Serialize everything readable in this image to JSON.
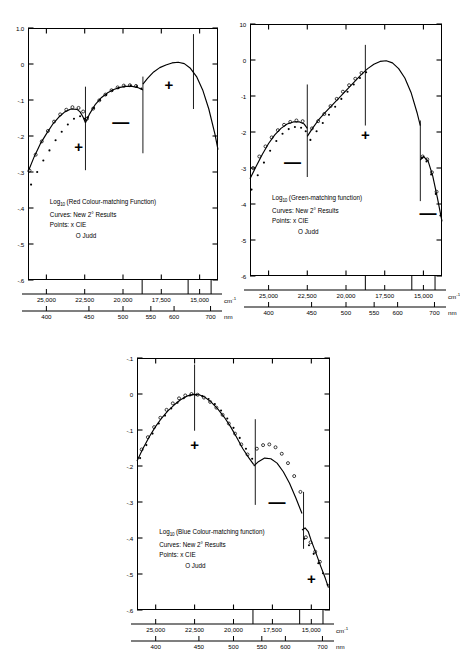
{
  "figure": {
    "title": "",
    "panel_count": 3
  },
  "common": {
    "x_axis_primary": {
      "unit": "cm",
      "unit_sup": "-1",
      "ticks": [
        "25,000",
        "22,500",
        "20,000",
        "17,500",
        "15,000"
      ],
      "tick_values": [
        25000,
        22500,
        20000,
        17500,
        15000
      ]
    },
    "x_axis_secondary": {
      "unit": "nm",
      "ticks": [
        "400",
        "450",
        "500",
        "550",
        "600",
        "700"
      ],
      "tick_values": [
        400,
        450,
        500,
        550,
        600,
        700
      ]
    },
    "legend": {
      "curves_label": "Curves:",
      "curves_value": "New 2° Results",
      "points_label": "Points:",
      "points_value_1": "x  CIE",
      "points_value_2": "O  Judd"
    },
    "axis_color": "#000000"
  },
  "panels": [
    {
      "id": "red",
      "title_prefix": "Log",
      "title_sub": "10",
      "title_main": "(Red Colour-matching Function)",
      "y_ticks": [
        "1.0",
        "0",
        "-.1",
        "-.2",
        "-.3",
        "-.4",
        "-.5",
        "-.6"
      ],
      "y_tick_values": [
        0.1,
        0,
        -0.1,
        -0.2,
        -0.3,
        -0.4,
        -0.5,
        -0.6
      ],
      "ylim": [
        -0.6,
        0.1
      ],
      "xlim": [
        26200,
        13800
      ],
      "sign_markers": [
        {
          "sign": "+",
          "x": 22900,
          "y": -0.228
        },
        {
          "sign": "—",
          "x": 20150,
          "y": -0.162
        },
        {
          "sign": "+",
          "x": 17000,
          "y": -0.056
        }
      ],
      "dividers": [
        {
          "x": 22450,
          "y0": -0.295,
          "y1": -0.063
        },
        {
          "x": 18700,
          "y0": -0.248,
          "y1": -0.035
        },
        {
          "x": 15400,
          "y0": -0.125,
          "y1": 0.083
        }
      ]
    },
    {
      "id": "green",
      "title_prefix": "Log",
      "title_sub": "10",
      "title_main": "(Green-matching function)",
      "y_ticks": [
        "10",
        "0",
        "-1",
        "-2",
        "-3",
        "-4",
        "-5",
        "-6"
      ],
      "y_tick_values": [
        0.1,
        0,
        -0.1,
        -0.2,
        -0.3,
        -0.4,
        -0.5,
        -0.6
      ],
      "ylim": [
        -0.6,
        0.1
      ],
      "xlim": [
        26200,
        13800
      ],
      "sign_markers": [
        {
          "sign": "—",
          "x": 23450,
          "y": -0.283
        },
        {
          "sign": "+",
          "x": 18750,
          "y": -0.206
        },
        {
          "sign": "—",
          "x": 14700,
          "y": -0.425
        }
      ],
      "dividers": [
        {
          "x": 22500,
          "y0": -0.325,
          "y1": -0.068
        },
        {
          "x": 18750,
          "y0": -0.182,
          "y1": 0.042
        },
        {
          "x": 15200,
          "y0": -0.392,
          "y1": -0.168
        }
      ]
    },
    {
      "id": "blue",
      "title_prefix": "Log",
      "title_sub": "10",
      "title_main": "(Blue Colour-matching function)",
      "y_ticks": [
        "-.1",
        "0",
        "-.1",
        "-.2",
        "-.3",
        "-.4",
        "-.5",
        "-.6"
      ],
      "y_tick_values": [
        0.1,
        0,
        -0.1,
        -0.2,
        -0.3,
        -0.4,
        -0.5,
        -0.6
      ],
      "ylim": [
        -0.6,
        0.1
      ],
      "xlim": [
        26200,
        13800
      ],
      "sign_markers": [
        {
          "sign": "+",
          "x": 22500,
          "y": -0.139
        },
        {
          "sign": "—",
          "x": 17200,
          "y": -0.3
        },
        {
          "sign": "+",
          "x": 15000,
          "y": -0.51
        }
      ],
      "dividers": [
        {
          "x": 22500,
          "y0": -0.102,
          "y1": 0.082
        },
        {
          "x": 18600,
          "y0": -0.308,
          "y1": -0.07
        },
        {
          "x": 15500,
          "y0": -0.43,
          "y1": -0.272
        }
      ]
    }
  ],
  "chart_data": {
    "type": "line",
    "xlabel": "cm-1  /  nm",
    "ylabel": "Log10 (Colour-matching Function)",
    "xlim": [
      26200,
      13800
    ],
    "ylim": [
      -0.6,
      0.1
    ],
    "grid": false,
    "legend_position": "inside-lower-left",
    "charts": [
      {
        "name": "Red Colour-matching Function",
        "series": [
          {
            "name": "New 2° Results",
            "style": "curve",
            "x": [
              26200,
              25800,
              25400,
              25000,
              24600,
              24200,
              23800,
              23400,
              23000,
              22800,
              22600,
              22450,
              22450,
              22200,
              21800,
              21400,
              21000,
              20600,
              20200,
              19800,
              19400,
              19000,
              18700,
              18700,
              18400,
              18000,
              17600,
              17200,
              16800,
              16400,
              16000,
              15600,
              15200,
              14800,
              14400,
              14000,
              13800
            ],
            "y": [
              -0.3,
              -0.258,
              -0.222,
              -0.194,
              -0.168,
              -0.148,
              -0.133,
              -0.125,
              -0.126,
              -0.133,
              -0.148,
              -0.163,
              -0.163,
              -0.14,
              -0.112,
              -0.093,
              -0.08,
              -0.071,
              -0.065,
              -0.062,
              -0.062,
              -0.066,
              -0.072,
              -0.056,
              -0.04,
              -0.022,
              -0.01,
              -0.003,
              0.003,
              0.005,
              0.001,
              -0.012,
              -0.035,
              -0.072,
              -0.125,
              -0.195,
              -0.238
            ]
          },
          {
            "name": "CIE",
            "style": "points",
            "marker": "x",
            "x": [
              26000,
              25600,
              25200,
              24800,
              24400,
              24000,
              23600,
              23200,
              22800,
              22500,
              22300,
              21900,
              21500,
              21100,
              20700,
              20300,
              19900,
              19500,
              19100,
              18800
            ],
            "y": [
              -0.335,
              -0.3,
              -0.268,
              -0.24,
              -0.212,
              -0.188,
              -0.168,
              -0.152,
              -0.145,
              -0.152,
              -0.148,
              -0.122,
              -0.1,
              -0.086,
              -0.074,
              -0.067,
              -0.062,
              -0.06,
              -0.062,
              -0.068
            ]
          },
          {
            "name": "Judd",
            "style": "points",
            "marker": "o",
            "x": [
              26100,
              25700,
              25300,
              24900,
              24500,
              24100,
              23700,
              23300,
              22900,
              22600,
              22350,
              21950,
              21550,
              21150,
              20750,
              20350,
              19950,
              19550,
              19150
            ],
            "y": [
              -0.296,
              -0.252,
              -0.215,
              -0.186,
              -0.16,
              -0.14,
              -0.127,
              -0.12,
              -0.122,
              -0.132,
              -0.152,
              -0.124,
              -0.101,
              -0.085,
              -0.073,
              -0.065,
              -0.06,
              -0.059,
              -0.061
            ]
          }
        ],
        "annotations": [
          {
            "text": "+",
            "x": 22900,
            "y": -0.228
          },
          {
            "text": "—",
            "x": 20150,
            "y": -0.162
          },
          {
            "text": "+",
            "x": 17000,
            "y": -0.056
          }
        ]
      },
      {
        "name": "Green-matching function",
        "series": [
          {
            "name": "New 2° Results",
            "style": "curve",
            "x": [
              26200,
              25800,
              25400,
              25000,
              24600,
              24200,
              23800,
              23400,
              23000,
              22700,
              22500,
              22500,
              22200,
              21800,
              21400,
              21000,
              20600,
              20200,
              19800,
              19400,
              19000,
              18600,
              18200,
              17800,
              17400,
              17000,
              16600,
              16200,
              15800,
              15400,
              15200,
              15200,
              15000,
              14700,
              14400,
              14100,
              13800
            ],
            "y": [
              -0.33,
              -0.295,
              -0.262,
              -0.232,
              -0.208,
              -0.19,
              -0.178,
              -0.172,
              -0.172,
              -0.178,
              -0.19,
              -0.212,
              -0.192,
              -0.168,
              -0.148,
              -0.13,
              -0.112,
              -0.094,
              -0.076,
              -0.058,
              -0.04,
              -0.024,
              -0.012,
              -0.004,
              -0.002,
              -0.008,
              -0.024,
              -0.05,
              -0.09,
              -0.148,
              -0.182,
              -0.278,
              -0.268,
              -0.28,
              -0.322,
              -0.382,
              -0.448
            ]
          },
          {
            "name": "CIE",
            "style": "points",
            "marker": "x",
            "x": [
              26100,
              25700,
              25300,
              24900,
              24500,
              24100,
              23700,
              23300,
              22900,
              22600,
              22300,
              21900,
              21500,
              21100,
              20700,
              20300,
              19900,
              19500,
              19100,
              18700,
              15100,
              14800,
              14500,
              14200,
              13900
            ],
            "y": [
              -0.36,
              -0.32,
              -0.285,
              -0.252,
              -0.225,
              -0.205,
              -0.192,
              -0.186,
              -0.188,
              -0.198,
              -0.222,
              -0.198,
              -0.175,
              -0.152,
              -0.13,
              -0.108,
              -0.088,
              -0.068,
              -0.05,
              -0.034,
              -0.272,
              -0.282,
              -0.318,
              -0.372,
              -0.432
            ]
          },
          {
            "name": "Judd",
            "style": "points",
            "marker": "o",
            "x": [
              26000,
              25600,
              25200,
              24800,
              24400,
              24000,
              23600,
              23200,
              22800,
              22200,
              21800,
              21400,
              21000,
              20600,
              20200,
              19800,
              19400,
              19000,
              15050,
              14750,
              14450,
              14150
            ],
            "y": [
              -0.3,
              -0.268,
              -0.24,
              -0.215,
              -0.195,
              -0.18,
              -0.172,
              -0.168,
              -0.17,
              -0.19,
              -0.17,
              -0.15,
              -0.128,
              -0.108,
              -0.088,
              -0.07,
              -0.052,
              -0.036,
              -0.268,
              -0.276,
              -0.312,
              -0.366
            ]
          }
        ],
        "annotations": [
          {
            "text": "—",
            "x": 23450,
            "y": -0.283
          },
          {
            "text": "+",
            "x": 18750,
            "y": -0.206
          },
          {
            "text": "—",
            "x": 14700,
            "y": -0.425
          }
        ]
      },
      {
        "name": "Blue Colour-matching function",
        "series": [
          {
            "name": "New 2° Results",
            "style": "curve",
            "x": [
              26200,
              25800,
              25400,
              25000,
              24600,
              24200,
              23800,
              23400,
              23000,
              22600,
              22200,
              21800,
              21400,
              21000,
              20600,
              20200,
              19800,
              19400,
              19000,
              18700,
              18700,
              18400,
              18000,
              17600,
              17200,
              16800,
              16400,
              16000,
              15600,
              15600,
              15400,
              15200,
              15000,
              14700,
              14400,
              14100,
              13900
            ],
            "y": [
              -0.186,
              -0.15,
              -0.118,
              -0.09,
              -0.066,
              -0.046,
              -0.03,
              -0.016,
              -0.006,
              -0.001,
              -0.002,
              -0.01,
              -0.024,
              -0.042,
              -0.064,
              -0.09,
              -0.12,
              -0.152,
              -0.178,
              -0.196,
              -0.2,
              -0.188,
              -0.178,
              -0.18,
              -0.192,
              -0.216,
              -0.248,
              -0.288,
              -0.332,
              -0.378,
              -0.372,
              -0.382,
              -0.408,
              -0.442,
              -0.478,
              -0.512,
              -0.538
            ]
          },
          {
            "name": "CIE",
            "style": "points",
            "marker": "x",
            "x": [
              26000,
              25600,
              25200,
              24800,
              24400,
              24000,
              23600,
              23200,
              22800,
              22400,
              22000,
              21600,
              21200,
              20800,
              20400,
              20000,
              19600,
              19200,
              18800,
              15450,
              15150,
              14850,
              14550,
              14250,
              13950
            ],
            "y": [
              -0.178,
              -0.142,
              -0.11,
              -0.082,
              -0.06,
              -0.04,
              -0.024,
              -0.012,
              -0.004,
              -0.002,
              -0.006,
              -0.014,
              -0.028,
              -0.046,
              -0.068,
              -0.094,
              -0.122,
              -0.152,
              -0.18,
              -0.402,
              -0.42,
              -0.444,
              -0.47,
              -0.498,
              -0.53
            ]
          },
          {
            "name": "Judd",
            "style": "points",
            "marker": "o",
            "x": [
              25900,
              25500,
              25100,
              24700,
              24300,
              23900,
              23500,
              23100,
              22700,
              22300,
              21900,
              21500,
              21100,
              20700,
              20300,
              19900,
              19500,
              19100,
              18500,
              18100,
              17700,
              17300,
              16900,
              16500,
              16100,
              15700,
              15350,
              15050,
              14750,
              14450
            ],
            "y": [
              -0.154,
              -0.12,
              -0.092,
              -0.066,
              -0.044,
              -0.026,
              -0.012,
              -0.004,
              0.0,
              -0.002,
              -0.01,
              -0.022,
              -0.038,
              -0.058,
              -0.082,
              -0.11,
              -0.14,
              -0.168,
              -0.152,
              -0.142,
              -0.14,
              -0.148,
              -0.166,
              -0.192,
              -0.228,
              -0.272,
              -0.398,
              -0.412,
              -0.438,
              -0.466
            ]
          }
        ],
        "annotations": [
          {
            "text": "+",
            "x": 22500,
            "y": -0.139
          },
          {
            "text": "—",
            "x": 17200,
            "y": -0.3
          },
          {
            "text": "+",
            "x": 15000,
            "y": -0.51
          }
        ]
      }
    ]
  }
}
